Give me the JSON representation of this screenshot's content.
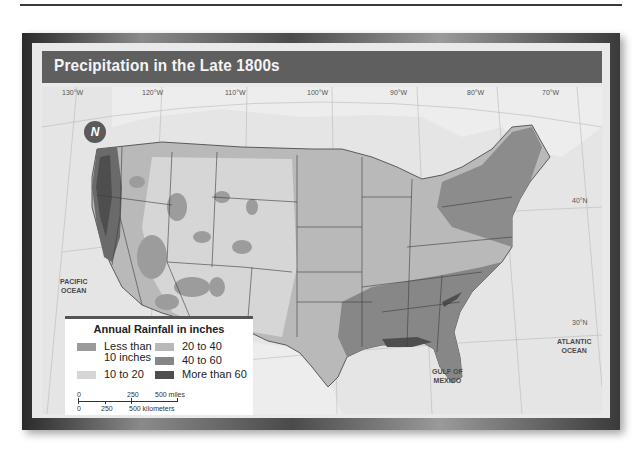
{
  "title": "Precipitation in the Late 1800s",
  "longitudes": [
    "130°W",
    "120°W",
    "110°W",
    "100°W",
    "90°W",
    "80°W",
    "70°W"
  ],
  "latitudes": [
    "40°N",
    "30°N"
  ],
  "oceans": {
    "pacific": [
      "PACIFIC",
      "OCEAN"
    ],
    "atlantic": [
      "ATLANTIC",
      "OCEAN"
    ],
    "gulf": [
      "GULF OF",
      "MEXICO"
    ]
  },
  "compass": {
    "letter": "N"
  },
  "legend": {
    "title": "Annual Rainfall in inches",
    "items": [
      {
        "label_line1": "Less than",
        "label_line2": "10 inches",
        "color": "#9a9a9a"
      },
      {
        "label_line1": "10 to 20",
        "label_line2": "",
        "color": "#d6d6d6"
      },
      {
        "label_line1": "20 to 40",
        "label_line2": "",
        "color": "#b8b8b8"
      },
      {
        "label_line1": "40 to 60",
        "label_line2": "",
        "color": "#868686"
      },
      {
        "label_line1": "More than 60",
        "label_line2": "",
        "color": "#4e4e4e"
      }
    ]
  },
  "scale": {
    "miles": [
      "0",
      "250",
      "500 miles"
    ],
    "kilometers": [
      "0",
      "250",
      "500 kilometers"
    ]
  },
  "colors": {
    "title_bar": "#5f5f5f",
    "land_outside": "#e8e8e8",
    "ocean": "#e4e4e4",
    "border": "#3c3c3c"
  }
}
